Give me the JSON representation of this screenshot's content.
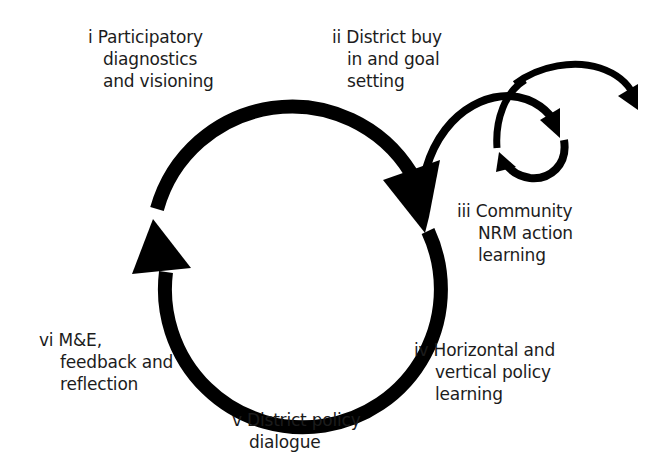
{
  "diagram": {
    "type": "cycle",
    "stroke_color": "#000000",
    "background_color": "#ffffff",
    "stages": [
      {
        "numeral": "i",
        "lines": [
          "i Participatory",
          "diagnostics",
          "and visioning"
        ]
      },
      {
        "numeral": "ii",
        "lines": [
          "ii District buy",
          "in and goal",
          "setting"
        ]
      },
      {
        "numeral": "iii",
        "lines": [
          "iii Community",
          "NRM action",
          "learning"
        ]
      },
      {
        "numeral": "iv",
        "lines": [
          "iv Horizontal and",
          "vertical policy",
          "learning"
        ]
      },
      {
        "numeral": "v",
        "lines": [
          "v District policy",
          "dialogue"
        ]
      },
      {
        "numeral": "vi",
        "lines": [
          "vi M&E,",
          "feedback and",
          "reflection"
        ]
      }
    ],
    "arrows": [
      {
        "name": "main-cycle-top-arrow",
        "from": "i",
        "to": "iii",
        "direction": "clockwise"
      },
      {
        "name": "main-cycle-bottom-arrow",
        "from": "iii",
        "to": "i",
        "direction": "clockwise"
      },
      {
        "name": "community-loop-arc",
        "from": "iii",
        "to": "iii",
        "direction": "clockwise-spiral"
      },
      {
        "name": "outward-arc",
        "from": "iii",
        "to": "outside",
        "direction": "outward"
      }
    ]
  }
}
